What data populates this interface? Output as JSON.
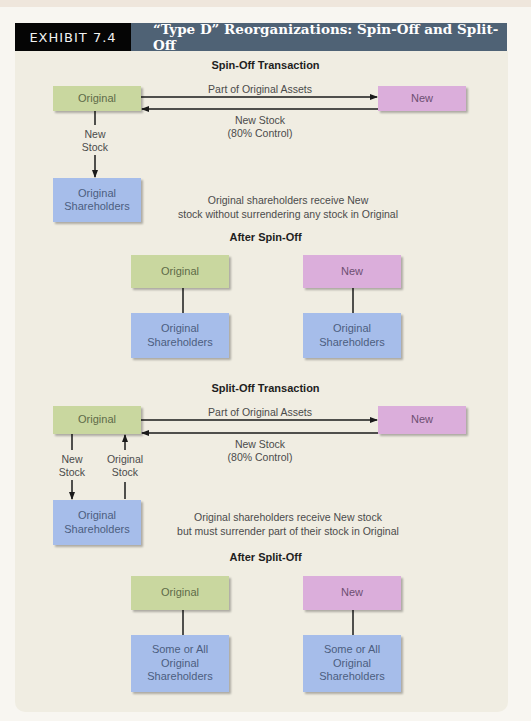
{
  "header": {
    "exhibit_label": "EXHIBIT 7.4",
    "title": "“Type D” Reorganizations: Spin-Off and Split-Off"
  },
  "colors": {
    "header_black": "#050505",
    "header_slate": "#4f6275",
    "panel_bg": "#f0ede2",
    "original_box": "#c9d79f",
    "new_box": "#dbaedb",
    "shareholders_box": "#a6bdea"
  },
  "spin_off": {
    "title": "Spin-Off Transaction",
    "original": "Original",
    "new": "New",
    "arrow_to_new_label": "Part of Original Assets",
    "arrow_to_original_label": "New Stock\n(80% Control)",
    "down_label": "New\nStock",
    "shareholders": "Original\nShareholders",
    "description": "Original shareholders receive New\nstock without surrendering any stock in Original"
  },
  "after_spin_off": {
    "title": "After Spin-Off",
    "original": "Original",
    "new": "New",
    "original_shareholders": "Original\nShareholders",
    "new_shareholders": "Original\nShareholders"
  },
  "split_off": {
    "title": "Split-Off Transaction",
    "original": "Original",
    "new": "New",
    "arrow_to_new_label": "Part of Original Assets",
    "arrow_to_original_label": "New Stock\n(80% Control)",
    "down_label": "New\nStock",
    "up_label": "Original\nStock",
    "shareholders": "Original\nShareholders",
    "description": "Original shareholders receive New stock\nbut must surrender part of their stock in Original"
  },
  "after_split_off": {
    "title": "After Split-Off",
    "original": "Original",
    "new": "New",
    "original_shareholders": "Some or All\nOriginal\nShareholders",
    "new_shareholders": "Some or All\nOriginal\nShareholders"
  }
}
